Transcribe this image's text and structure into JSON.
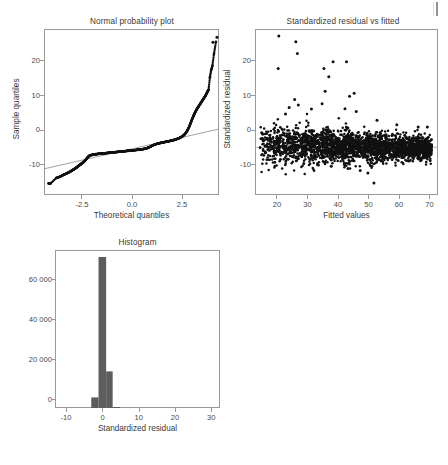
{
  "figure": {
    "background": "#ffffff",
    "point_color": "#111111",
    "bar_color": "#5d5d5d",
    "line_color": "#8c8c8c",
    "frame_color": "#9a9a9a"
  },
  "chart_data": [
    {
      "type": "scatter",
      "name": "normal-probability-plot",
      "title": "Normal probability plot",
      "xlabel": "Theoretical quantiles",
      "ylabel": "Sample quartiles",
      "xlim": [
        -4.35,
        4.35
      ],
      "ylim": [
        -11.5,
        28.5
      ],
      "xticks": [
        -2.5,
        0.0,
        2.5
      ],
      "xticklabels": [
        "-2.5",
        "0.0",
        "2.5"
      ],
      "yticks": [
        -10,
        0,
        10,
        20
      ],
      "yticklabels": [
        "-10",
        "0",
        "10",
        "20"
      ],
      "grid": false,
      "reference_line": {
        "x": [
          -4.35,
          4.35
        ],
        "y": [
          -5.2,
          4.4
        ]
      },
      "x": [
        -4.12,
        -4.02,
        -3.74,
        -3.62,
        -3.52,
        -3.44,
        -3.36,
        -3.29,
        -3.22,
        -3.16,
        -3.1,
        -3.04,
        -2.99,
        -2.94,
        -2.89,
        -2.84,
        -2.8,
        -2.75,
        -2.71,
        -2.67,
        -2.63,
        -2.59,
        -2.55,
        -2.51,
        -2.47,
        -2.43,
        -2.39,
        -2.35,
        -2.31,
        -2.27,
        -2.22,
        -2.17,
        -2.12,
        -2.07,
        -2.01,
        -1.95,
        -1.89,
        -1.83,
        -1.77,
        -1.71,
        -1.65,
        -1.59,
        -1.53,
        -1.47,
        -1.41,
        -1.35,
        -1.29,
        -1.23,
        -1.17,
        -1.11,
        -1.05,
        -0.99,
        -0.93,
        -0.87,
        -0.81,
        -0.75,
        -0.69,
        -0.63,
        -0.57,
        -0.51,
        -0.45,
        -0.39,
        -0.33,
        -0.27,
        -0.21,
        -0.15,
        -0.09,
        -0.03,
        0.03,
        0.09,
        0.15,
        0.21,
        0.27,
        0.33,
        0.39,
        0.45,
        0.51,
        0.57,
        0.63,
        0.69,
        0.75,
        0.81,
        0.87,
        0.93,
        0.99,
        1.05,
        1.11,
        1.17,
        1.23,
        1.29,
        1.35,
        1.41,
        1.47,
        1.53,
        1.59,
        1.65,
        1.71,
        1.77,
        1.83,
        1.89,
        1.95,
        2.01,
        2.07,
        2.13,
        2.19,
        2.25,
        2.31,
        2.37,
        2.43,
        2.49,
        2.55,
        2.61,
        2.67,
        2.72,
        2.77,
        2.82,
        2.87,
        2.91,
        2.95,
        2.99,
        3.03,
        3.07,
        3.11,
        3.15,
        3.19,
        3.23,
        3.27,
        3.31,
        3.35,
        3.39,
        3.43,
        3.47,
        3.51,
        3.55,
        3.59,
        3.63,
        3.67,
        3.71,
        3.75,
        3.79,
        3.83,
        3.9,
        3.96,
        4.02,
        4.1,
        4.2
      ],
      "y": [
        -8.7,
        -8.7,
        -7.4,
        -7.2,
        -7.0,
        -6.8,
        -6.6,
        -6.45,
        -6.3,
        -6.15,
        -6.0,
        -5.85,
        -5.7,
        -5.55,
        -5.4,
        -5.25,
        -5.1,
        -4.95,
        -4.8,
        -4.65,
        -4.5,
        -4.35,
        -4.2,
        -4.05,
        -3.9,
        -3.75,
        -3.6,
        -3.4,
        -3.2,
        -3.0,
        -2.7,
        -2.4,
        -2.15,
        -2.0,
        -1.9,
        -1.82,
        -1.76,
        -1.71,
        -1.67,
        -1.63,
        -1.6,
        -1.57,
        -1.54,
        -1.51,
        -1.48,
        -1.45,
        -1.42,
        -1.39,
        -1.36,
        -1.33,
        -1.3,
        -1.27,
        -1.24,
        -1.21,
        -1.18,
        -1.15,
        -1.12,
        -1.09,
        -1.06,
        -1.03,
        -1.0,
        -0.97,
        -0.94,
        -0.91,
        -0.88,
        -0.85,
        -0.82,
        -0.79,
        -0.76,
        -0.73,
        -0.7,
        -0.67,
        -0.64,
        -0.61,
        -0.58,
        -0.54,
        -0.5,
        -0.45,
        -0.4,
        -0.33,
        -0.25,
        -0.15,
        -0.02,
        0.12,
        0.28,
        0.42,
        0.55,
        0.66,
        0.76,
        0.85,
        0.93,
        1.0,
        1.07,
        1.13,
        1.19,
        1.25,
        1.31,
        1.37,
        1.43,
        1.49,
        1.56,
        1.63,
        1.7,
        1.78,
        1.87,
        1.97,
        2.08,
        2.2,
        2.34,
        2.5,
        2.7,
        2.95,
        3.25,
        3.6,
        4.0,
        4.45,
        4.95,
        5.45,
        5.95,
        6.45,
        6.95,
        7.4,
        7.85,
        8.25,
        8.65,
        9.0,
        9.35,
        9.65,
        9.95,
        10.25,
        10.55,
        10.85,
        11.15,
        11.45,
        11.75,
        12.05,
        12.35,
        12.7,
        13.1,
        13.5,
        13.85,
        16.9,
        18.6,
        19.6,
        22.5,
        25.4
      ],
      "extra_points": {
        "x": [
          4.05,
          4.25
        ],
        "y": [
          25.3,
          26.5
        ]
      }
    },
    {
      "type": "scatter",
      "name": "standardized-residual-vs-fitted",
      "title": "Standardized residual vs fitted",
      "xlabel": "Fitted values",
      "ylabel": "Standardized residual",
      "xlim": [
        13.0,
        73.0
      ],
      "ylim": [
        -11.5,
        28.5
      ],
      "xticks": [
        20,
        30,
        40,
        50,
        60,
        70
      ],
      "xticklabels": [
        "20",
        "30",
        "40",
        "50",
        "60",
        "70"
      ],
      "yticks": [
        -10,
        0,
        10,
        20
      ],
      "yticklabels": [
        "-10",
        "0",
        "10",
        "20"
      ],
      "grid": false,
      "zero_line": 0,
      "cloud": {
        "n": 2600,
        "x_range": [
          14.5,
          71.0
        ],
        "description": "dense wedge-shaped cloud of residuals centered near 0, widest at low fitted values, tapering right"
      },
      "outliers": {
        "x": [
          20.8,
          26.4,
          26.9,
          20.6,
          35.6,
          38.6,
          43.0,
          37.2,
          36.0,
          45.5,
          44.0,
          26.0,
          27.2,
          24.2,
          23.0,
          31.5,
          35.0,
          42.5,
          46.2,
          53.0,
          59.5,
          66.5,
          69.5,
          52.0,
          50.0,
          47.5,
          43.5,
          38.0,
          33.5,
          29.0
        ],
        "y": [
          26.8,
          25.4,
          22.6,
          19.0,
          19.0,
          20.6,
          20.6,
          17.0,
          13.5,
          13.0,
          12.3,
          11.5,
          10.2,
          9.6,
          8.0,
          9.2,
          10.5,
          9.3,
          8.6,
          6.5,
          5.4,
          4.9,
          4.9,
          -8.6,
          -6.2,
          -5.6,
          -5.1,
          -4.6,
          -4.2,
          -3.9
        ]
      }
    },
    {
      "type": "bar",
      "name": "histogram",
      "title": "Histogram",
      "xlabel": "Standardized residual",
      "ylabel": "",
      "xlim": [
        -13.0,
        32.5
      ],
      "ylim": [
        0,
        79000
      ],
      "xticks": [
        -10,
        0,
        10,
        20,
        30
      ],
      "xticklabels": [
        "-10",
        "0",
        "10",
        "20",
        "30"
      ],
      "yticks": [
        0,
        20000,
        40000,
        60000
      ],
      "yticklabels": [
        "0",
        "20 000",
        "40 000",
        "60 000"
      ],
      "grid": false,
      "bin_width": 2.5,
      "bin_edges": [
        -2.5,
        0.0,
        2.5,
        5.0
      ],
      "categories": [
        "-2.5",
        "0.0",
        "2.5",
        "5.0"
      ],
      "values": [
        5300,
        75500,
        18300,
        500
      ],
      "bars": [
        {
          "left": -3.0,
          "right": -1.0,
          "height": 5300
        },
        {
          "left": -1.0,
          "right": 1.1,
          "height": 75500
        },
        {
          "left": 1.1,
          "right": 2.9,
          "height": 18300
        },
        {
          "left": 2.9,
          "right": 5.0,
          "height": 500
        }
      ]
    }
  ]
}
